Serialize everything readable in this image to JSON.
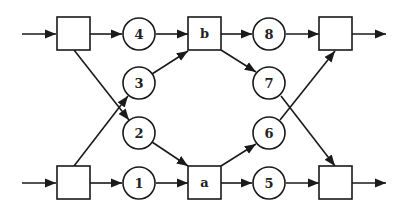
{
  "diagram": {
    "type": "petri-net-style flow graph",
    "colors": {
      "stroke": "#1a1a1a",
      "background": "#ffffff"
    },
    "boxes": [
      {
        "id": "box-top-left",
        "label": ""
      },
      {
        "id": "box-b",
        "label": "b"
      },
      {
        "id": "box-top-right",
        "label": ""
      },
      {
        "id": "box-bottom-left",
        "label": ""
      },
      {
        "id": "box-a",
        "label": "a"
      },
      {
        "id": "box-bottom-right",
        "label": ""
      }
    ],
    "circles": [
      {
        "id": "circle-1",
        "label": "1"
      },
      {
        "id": "circle-2",
        "label": "2"
      },
      {
        "id": "circle-3",
        "label": "3"
      },
      {
        "id": "circle-4",
        "label": "4"
      },
      {
        "id": "circle-5",
        "label": "5"
      },
      {
        "id": "circle-6",
        "label": "6"
      },
      {
        "id": "circle-7",
        "label": "7"
      },
      {
        "id": "circle-8",
        "label": "8"
      }
    ],
    "edges": [
      [
        "input-top",
        "box-top-left"
      ],
      [
        "box-top-left",
        "circle-4"
      ],
      [
        "circle-4",
        "box-b"
      ],
      [
        "box-b",
        "circle-8"
      ],
      [
        "circle-8",
        "box-top-right"
      ],
      [
        "box-top-right",
        "output-top"
      ],
      [
        "box-top-left",
        "circle-2"
      ],
      [
        "box-bottom-left",
        "circle-3"
      ],
      [
        "circle-3",
        "box-b"
      ],
      [
        "box-b",
        "circle-7"
      ],
      [
        "circle-2",
        "box-a"
      ],
      [
        "box-a",
        "circle-6"
      ],
      [
        "circle-6",
        "box-top-right"
      ],
      [
        "circle-7",
        "box-bottom-right"
      ],
      [
        "input-bottom",
        "box-bottom-left"
      ],
      [
        "box-bottom-left",
        "circle-1"
      ],
      [
        "circle-1",
        "box-a"
      ],
      [
        "box-a",
        "circle-5"
      ],
      [
        "circle-5",
        "box-bottom-right"
      ],
      [
        "box-bottom-right",
        "output-bottom"
      ]
    ]
  }
}
